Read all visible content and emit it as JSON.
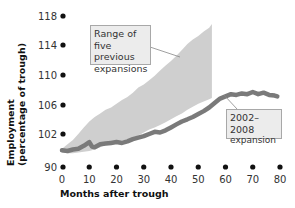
{
  "chart_data": {
    "type": "area",
    "title": "",
    "xlabel": "Months after trough",
    "ylabel": "Employment (percentage of trough)",
    "x_ticks": [
      0,
      10,
      20,
      30,
      40,
      50,
      60,
      70,
      80
    ],
    "y_ticks": [
      90,
      102,
      106,
      110,
      114,
      118
    ],
    "y_tick_labels": [
      "90",
      "102",
      "106",
      "110",
      "114",
      "118"
    ],
    "xlim": [
      0,
      80
    ],
    "ylim": [
      98,
      118
    ],
    "grid": false,
    "legend": "none (inline annotations)",
    "series": [
      {
        "name": "Range of five previous expansions",
        "kind": "band",
        "color": "#cfcfcf",
        "x": [
          0,
          2,
          4,
          6,
          8,
          10,
          12,
          14,
          16,
          18,
          20,
          22,
          24,
          26,
          28,
          30,
          32,
          34,
          36,
          38,
          40,
          42,
          44,
          46,
          48,
          50,
          52,
          54,
          55
        ],
        "upper": [
          100.0,
          100.6,
          101.2,
          102.0,
          102.9,
          103.7,
          104.3,
          104.8,
          105.3,
          105.6,
          106.1,
          106.6,
          107.0,
          107.6,
          108.3,
          108.7,
          109.3,
          109.9,
          110.6,
          111.3,
          111.9,
          112.6,
          113.4,
          114.2,
          114.8,
          115.3,
          115.9,
          116.4,
          116.9
        ],
        "lower": [
          99.5,
          99.4,
          99.4,
          99.5,
          99.6,
          99.7,
          99.9,
          100.2,
          100.5,
          100.7,
          100.9,
          101.1,
          101.3,
          101.5,
          101.8,
          102.2,
          102.6,
          102.9,
          103.2,
          103.6,
          104.0,
          104.4,
          104.8,
          105.3,
          105.7,
          106.1,
          106.4,
          106.7,
          106.9
        ]
      },
      {
        "name": "2002–2008 expansion",
        "kind": "line",
        "color": "#7a7a7a",
        "x": [
          0,
          2,
          4,
          6,
          8,
          10,
          11,
          12,
          14,
          16,
          18,
          20,
          22,
          24,
          26,
          28,
          30,
          32,
          34,
          36,
          38,
          40,
          42,
          44,
          46,
          48,
          50,
          52,
          54,
          56,
          58,
          60,
          62,
          64,
          66,
          68,
          70,
          72,
          74,
          76,
          78,
          79
        ],
        "y": [
          99.8,
          99.7,
          99.9,
          100.0,
          100.4,
          100.9,
          100.3,
          100.2,
          100.6,
          100.7,
          100.8,
          100.9,
          100.8,
          101.0,
          101.3,
          101.5,
          101.7,
          102.0,
          102.3,
          102.2,
          102.5,
          102.9,
          103.3,
          103.7,
          104.0,
          104.3,
          104.7,
          105.1,
          105.6,
          106.2,
          106.8,
          107.1,
          107.4,
          107.3,
          107.5,
          107.4,
          107.7,
          107.4,
          107.6,
          107.3,
          107.2,
          107.1
        ]
      }
    ],
    "annotations": [
      {
        "text": "Range of five previous expansions",
        "points_to": "band"
      },
      {
        "text": "2002–2008 expansion",
        "points_to": "line"
      }
    ]
  },
  "labels": {
    "y_axis_line1": "Employment",
    "y_axis_line2": "(percentage of trough)",
    "x_axis": "Months after trough",
    "note_band": [
      "Range of five",
      "previous",
      "expansions"
    ],
    "note_line": [
      "2002–2008",
      "expansion"
    ]
  }
}
